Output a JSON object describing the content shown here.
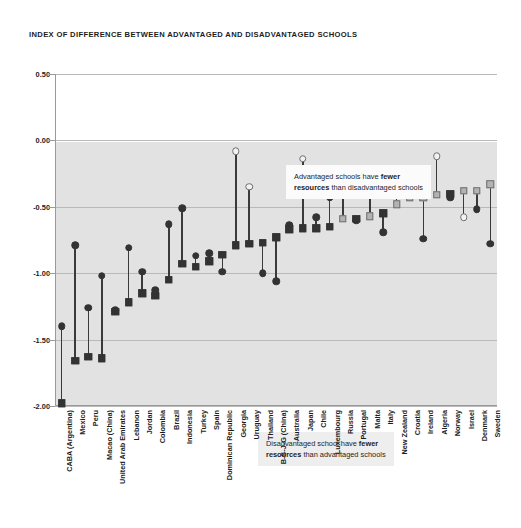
{
  "chart_data": {
    "type": "scatter",
    "title": "INDEX OF DIFFERENCE BETWEEN ADVANTAGED AND DISADVANTAGED SCHOOLS",
    "xlabel": "",
    "ylabel": "",
    "ylim": [
      -2.0,
      0.5
    ],
    "yticks": [
      0.5,
      0.0,
      -0.5,
      -1.0,
      -1.5,
      -2.0
    ],
    "ytick_labels": [
      "0.50",
      "0.00",
      "-0.50",
      "-1.00",
      "-1.50",
      "-2.00"
    ],
    "grid": true,
    "legend_position": "none",
    "shaded_region": {
      "from": 0.0,
      "to": -2.0,
      "color": "#e2e2e2"
    },
    "annotations": [
      {
        "id": "note-top",
        "line1_plain": "Advantaged schools have ",
        "line1_bold": "fewer",
        "line2_bold": "resources",
        "line2_plain": " than disadvantaged schools"
      },
      {
        "id": "note-bottom",
        "line1_plain": "Disadvantaged school have ",
        "line1_bold": "fewer",
        "line2_bold": "resources",
        "line2_plain": " than advantaged schools"
      }
    ],
    "categories": [
      "CABA (Argentina)",
      "Mexico",
      "Peru",
      "Macao (China)",
      "United Arab Emirates",
      "Lebanon",
      "Jordan",
      "Colombia",
      "Brazil",
      "Indonesia",
      "Turkey",
      "Spain",
      "Dominican Republic",
      "Georgia",
      "Uruguay",
      "Thailand",
      "B-S-J-G (China)",
      "Australia",
      "Japan",
      "Chile",
      "Luxembourg",
      "Russia",
      "Portugal",
      "Malta",
      "Italy",
      "New Zealand",
      "Croatia",
      "Ireland",
      "Algeria",
      "Norway",
      "Israel",
      "Denmark",
      "Sweden"
    ],
    "series": [
      {
        "name": "Circle marker",
        "marker": "circle",
        "values": [
          -1.4,
          -0.79,
          -1.26,
          -1.02,
          -1.28,
          -0.81,
          -0.99,
          -1.13,
          -0.63,
          -0.51,
          -0.87,
          -0.85,
          -0.99,
          -0.08,
          -0.35,
          -1.0,
          -1.06,
          -0.64,
          -0.14,
          -0.58,
          -0.43,
          -0.37,
          -0.6,
          -0.3,
          -0.69,
          -0.3,
          -0.32,
          -0.74,
          -0.12,
          -0.43,
          -0.58,
          -0.52,
          -0.78
        ],
        "fills": [
          "filled",
          "filled",
          "filled",
          "filled",
          "filled",
          "filled",
          "filled",
          "filled",
          "filled",
          "filled",
          "filled",
          "filled",
          "filled",
          "open",
          "open",
          "filled",
          "filled",
          "filled",
          "open",
          "filled",
          "filled",
          "open",
          "filled",
          "open",
          "filled",
          "open",
          "open",
          "filled",
          "open",
          "filled",
          "open",
          "filled",
          "filled"
        ]
      },
      {
        "name": "Square marker",
        "marker": "square",
        "values": [
          -1.98,
          -1.66,
          -1.63,
          -1.64,
          -1.29,
          -1.22,
          -1.15,
          -1.17,
          -1.05,
          -0.93,
          -0.95,
          -0.91,
          -0.86,
          -0.79,
          -0.78,
          -0.77,
          -0.73,
          -0.67,
          -0.66,
          -0.66,
          -0.65,
          -0.59,
          -0.59,
          -0.57,
          -0.55,
          -0.48,
          -0.43,
          -0.43,
          -0.41,
          -0.4,
          -0.38,
          -0.38,
          -0.33
        ],
        "fills": [
          "filled",
          "filled",
          "filled",
          "filled",
          "filled",
          "filled",
          "filled",
          "filled",
          "filled",
          "filled",
          "filled",
          "filled",
          "filled",
          "filled",
          "filled",
          "filled",
          "filled",
          "filled",
          "filled",
          "filled",
          "filled",
          "grey",
          "filled",
          "grey",
          "filled",
          "grey",
          "grey",
          "grey",
          "grey",
          "filled",
          "grey",
          "grey",
          "grey"
        ]
      }
    ]
  }
}
